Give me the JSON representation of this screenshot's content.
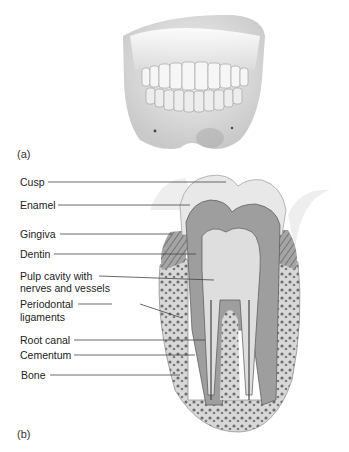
{
  "figure": {
    "panels": [
      {
        "id": "a",
        "label": "(a)",
        "subject": "Mandible with teeth, anterior view"
      },
      {
        "id": "b",
        "label": "(b)",
        "subject": "Molar tooth cross-section"
      }
    ],
    "tooth_labels": [
      {
        "text": "Cusp",
        "y": 182,
        "target": [
          226,
          182
        ]
      },
      {
        "text": "Enamel",
        "y": 205,
        "target": [
          190,
          205
        ]
      },
      {
        "text": "Gingiva",
        "y": 234,
        "target": [
          172,
          234
        ]
      },
      {
        "text": "Dentin",
        "y": 254,
        "target": [
          196,
          254
        ]
      },
      {
        "text": "Pulp cavity with",
        "text2": "nerves and vessels",
        "y": 276,
        "target": [
          214,
          280
        ]
      },
      {
        "text": "Periodontal",
        "text2": "ligaments",
        "y": 304,
        "target": [
          182,
          318
        ]
      },
      {
        "text": "Root canal",
        "y": 340,
        "target": [
          205,
          340
        ]
      },
      {
        "text": "Cementum",
        "y": 355,
        "target": [
          195,
          355
        ]
      },
      {
        "text": "Bone",
        "y": 375,
        "target": [
          180,
          375
        ]
      }
    ],
    "colors": {
      "enamel": "#e6e6e6",
      "dentin": "#9a9a9a",
      "pulp": "#d9d9d9",
      "bone": "#bdbdbd",
      "gingiva": "#a8a8a8",
      "line": "#444444"
    }
  }
}
